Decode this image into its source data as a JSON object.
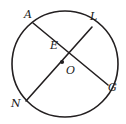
{
  "figure": {
    "background_color": "#ffffff",
    "stroke_color": "#231f20",
    "label_color": "#1a1a1a",
    "canvas": {
      "width": 126,
      "height": 124
    }
  },
  "circle": {
    "name": "circle-O",
    "center": {
      "x": 65,
      "y": 64
    },
    "radius": 53,
    "stroke_width": 1.6,
    "fill": "none"
  },
  "center_point": {
    "label": "O",
    "dot": {
      "x": 62,
      "y": 62,
      "r": 2.1
    },
    "label_pos": {
      "x": 66,
      "y": 65
    }
  },
  "intersection_point": {
    "label": "E",
    "pos": {
      "x": 64.5,
      "y": 50
    },
    "label_pos": {
      "x": 50,
      "y": 40
    }
  },
  "chords": [
    {
      "name": "chord-AG",
      "from": "A",
      "to": "G",
      "start": {
        "x": 33,
        "y": 23
      },
      "end": {
        "x": 108,
        "y": 85
      },
      "stroke_width": 1.6
    },
    {
      "name": "chord-LN",
      "from": "L",
      "to": "N",
      "start": {
        "x": 92,
        "y": 27
      },
      "end": {
        "x": 26,
        "y": 101
      },
      "stroke_width": 1.6
    }
  ],
  "points": [
    {
      "id": "A",
      "label": "A",
      "on": "circle",
      "point": {
        "x": 33,
        "y": 23
      },
      "label_pos": {
        "x": 24,
        "y": 9
      }
    },
    {
      "id": "L",
      "label": "L",
      "on": "circle",
      "point": {
        "x": 92,
        "y": 27
      },
      "label_pos": {
        "x": 90,
        "y": 11
      }
    },
    {
      "id": "N",
      "label": "N",
      "on": "circle",
      "point": {
        "x": 26,
        "y": 101
      },
      "label_pos": {
        "x": 11,
        "y": 98
      }
    },
    {
      "id": "G",
      "label": "G",
      "on": "circle",
      "point": {
        "x": 108,
        "y": 85
      },
      "label_pos": {
        "x": 108,
        "y": 82
      }
    },
    {
      "id": "E",
      "label": "E",
      "on": "intersection",
      "point": {
        "x": 64.5,
        "y": 50
      },
      "label_pos": {
        "x": 50,
        "y": 40
      }
    },
    {
      "id": "O",
      "label": "O",
      "on": "center",
      "point": {
        "x": 62,
        "y": 62
      },
      "label_pos": {
        "x": 66,
        "y": 65
      }
    }
  ]
}
